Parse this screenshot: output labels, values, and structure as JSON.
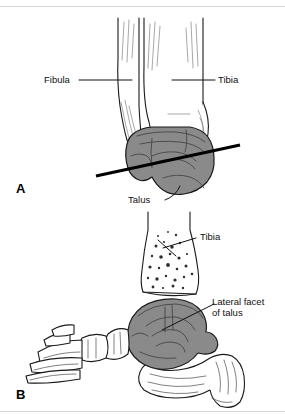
{
  "figure": {
    "background_color": "#ffffff",
    "line_color": "#1a1a1a",
    "talus_fill_color": "#8a8a8a",
    "bone_fill_color": "#ffffff",
    "rule_color": "#d8d8d8"
  },
  "panels": [
    {
      "letter": "A",
      "name": "anterior-ankle-view",
      "labels": [
        {
          "text": "Fibula",
          "name": "label-fibula"
        },
        {
          "text": "Tibia",
          "name": "label-tibia"
        },
        {
          "text": "Talus",
          "name": "label-talus"
        }
      ],
      "annotations": [
        {
          "name": "section-plane-line",
          "description": "oblique transverse line across talus"
        }
      ]
    },
    {
      "letter": "B",
      "name": "lateral-foot-view",
      "labels": [
        {
          "text": "Tibia",
          "name": "label-tibia"
        },
        {
          "text": "Lateral facet",
          "text2": "of talus",
          "name": "label-lateral-facet-of-talus"
        }
      ]
    }
  ]
}
